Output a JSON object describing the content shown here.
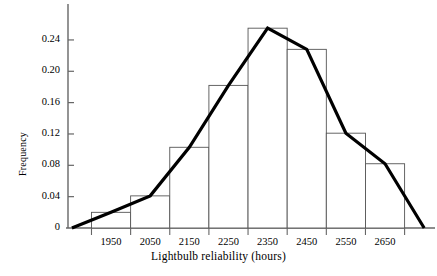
{
  "chart_data": {
    "type": "bar",
    "title": "",
    "subtitle": "",
    "xlabel": "Lightbulb reliability (hours)",
    "ylabel": "Frequency",
    "categories": [
      "1950",
      "2050",
      "2150",
      "2250",
      "2350",
      "2450",
      "2550",
      "2650"
    ],
    "bin_edges": [
      1900,
      2000,
      2100,
      2200,
      2300,
      2400,
      2500,
      2600,
      2700
    ],
    "values": [
      0.02,
      0.041,
      0.103,
      0.182,
      0.255,
      0.228,
      0.121,
      0.082
    ],
    "xlim": [
      1840,
      2770
    ],
    "ylim": [
      0,
      0.268
    ],
    "yticks": [
      "0",
      "0.04",
      "0.08",
      "0.12",
      "0.16",
      "0.20",
      "0.24"
    ],
    "ytick_values": [
      0,
      0.04,
      0.08,
      0.12,
      0.16,
      0.2,
      0.24
    ],
    "xticks": [
      "1950",
      "2050",
      "2150",
      "2250",
      "2350",
      "2450",
      "2550",
      "2650"
    ],
    "xtick_values": [
      1950,
      2050,
      2150,
      2250,
      2350,
      2450,
      2550,
      2650
    ],
    "grid": false,
    "legend": null,
    "overlay": {
      "type": "line",
      "name": "frequency-polygon",
      "x": [
        1850,
        1950,
        2050,
        2150,
        2250,
        2350,
        2450,
        2550,
        2650,
        2750
      ],
      "y": [
        0.0,
        0.02,
        0.041,
        0.103,
        0.182,
        0.255,
        0.228,
        0.121,
        0.082,
        0.0
      ],
      "color": "#000000",
      "width": 3.2
    },
    "bar_style": {
      "fill": "#ffffff",
      "stroke": "#555555",
      "stroke_width": 0.9
    },
    "axis_color": "#666666"
  },
  "axes": {
    "y_title": "Frequency",
    "x_title": "Lightbulb reliability (hours)"
  }
}
